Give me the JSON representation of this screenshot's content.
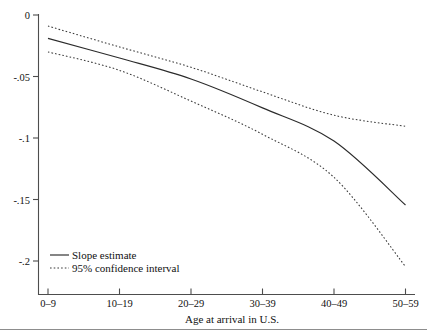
{
  "chart_data": {
    "type": "line",
    "title": "",
    "xlabel": "Age at arrival in U.S.",
    "ylabel": "",
    "categories": [
      "0–9",
      "10–19",
      "20–29",
      "30–39",
      "40–49",
      "50–59"
    ],
    "x": [
      0,
      1,
      2,
      3,
      4,
      5
    ],
    "xlim": [
      -0.12,
      5.12
    ],
    "ylim": [
      -0.212,
      0.0
    ],
    "yticks": [
      0,
      -0.05,
      -0.1,
      -0.15,
      -0.2
    ],
    "ytick_labels": [
      "0",
      "-.05",
      "-.1",
      "-.15",
      "-.2"
    ],
    "grid": false,
    "legend_position": "bottom-left",
    "series": [
      {
        "name": "Slope estimate",
        "style": "solid",
        "values": [
          -0.019,
          -0.035,
          -0.052,
          -0.0755,
          -0.1025,
          -0.1545
        ]
      },
      {
        "name": "95% confidence interval",
        "style": "dotted",
        "bound": "upper",
        "values": [
          -0.009,
          -0.026,
          -0.0425,
          -0.0625,
          -0.0815,
          -0.0905
        ]
      },
      {
        "name": "95% confidence interval",
        "style": "dotted",
        "bound": "lower",
        "values": [
          -0.03,
          -0.045,
          -0.07,
          -0.097,
          -0.132,
          -0.2045
        ]
      }
    ]
  },
  "legend": {
    "entries": [
      {
        "label": "Slope estimate",
        "style": "solid"
      },
      {
        "label": "95% confidence interval",
        "style": "dotted"
      }
    ]
  },
  "axis": {
    "x_title": "Age at arrival in U.S."
  }
}
